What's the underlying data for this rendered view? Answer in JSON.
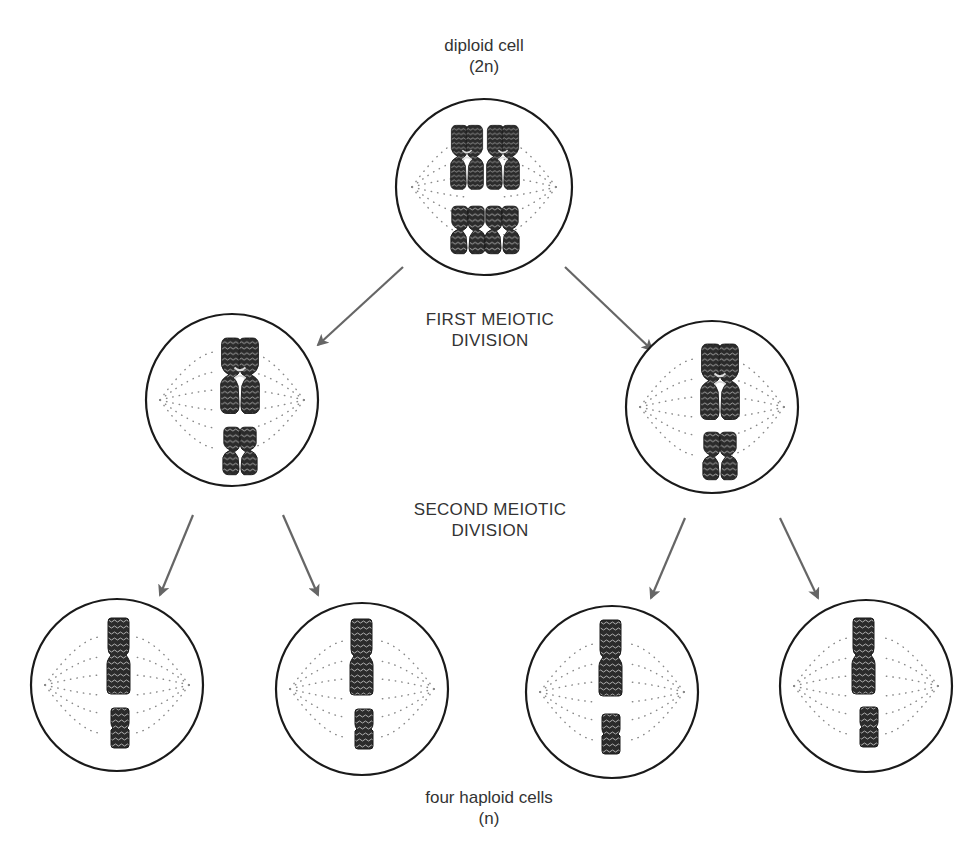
{
  "labels": {
    "top_line1": "diploid cell",
    "top_line2": "(2n)",
    "first_division_line1": "FIRST MEIOTIC",
    "first_division_line2": "DIVISION",
    "second_division_line1": "SECOND MEIOTIC",
    "second_division_line2": "DIVISION",
    "bottom_line1": "four haploid cells",
    "bottom_line2": "(n)"
  },
  "cells": [
    {
      "id": "diploid",
      "stage": "parent",
      "cx": 484,
      "cy": 187,
      "r": 88,
      "chromosomes": "2 homologous pairs (4 X-shaped)"
    },
    {
      "id": "meiosis1-left",
      "stage": "after first division",
      "cx": 232,
      "cy": 400,
      "r": 86,
      "chromosomes": "2 X-shaped"
    },
    {
      "id": "meiosis1-right",
      "stage": "after first division",
      "cx": 712,
      "cy": 407,
      "r": 86,
      "chromosomes": "2 X-shaped"
    },
    {
      "id": "haploid-1",
      "stage": "haploid",
      "cx": 117,
      "cy": 685,
      "r": 86,
      "chromosomes": "2 single chromatids"
    },
    {
      "id": "haploid-2",
      "stage": "haploid",
      "cx": 362,
      "cy": 689,
      "r": 86,
      "chromosomes": "2 single chromatids"
    },
    {
      "id": "haploid-3",
      "stage": "haploid",
      "cx": 612,
      "cy": 692,
      "r": 86,
      "chromosomes": "2 single chromatids"
    },
    {
      "id": "haploid-4",
      "stage": "haploid",
      "cx": 866,
      "cy": 686,
      "r": 86,
      "chromosomes": "2 single chromatids"
    }
  ],
  "colors": {
    "outline": "#1a1a1a",
    "arrow": "#666666",
    "chromosome": "#2b2b2b",
    "spindle_dot": "#888888",
    "text": "#333333"
  }
}
